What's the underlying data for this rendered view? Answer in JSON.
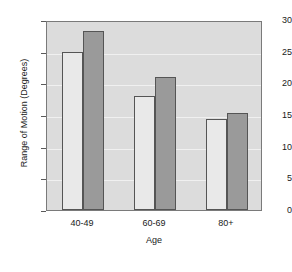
{
  "chart_data": {
    "type": "bar",
    "title": "",
    "xlabel": "Age",
    "ylabel": "Range of Motion (Degrees)",
    "categories": [
      "40-49",
      "60-69",
      "80+"
    ],
    "series": [
      {
        "name": "series-1",
        "color": "#e9e9e9",
        "values": [
          25.0,
          18.0,
          14.3
        ]
      },
      {
        "name": "series-2",
        "color": "#9a9a9a",
        "values": [
          28.3,
          21.0,
          15.3
        ]
      }
    ],
    "ylim": [
      0,
      30
    ],
    "yticks": [
      0,
      5,
      10,
      15,
      20,
      25,
      30
    ],
    "ytick_labels": [
      "0",
      "5",
      "10",
      "15",
      "20",
      "25",
      "30"
    ],
    "grid": true,
    "grid_axis": "y",
    "legend": "none",
    "plot_background": "#dcdcdc",
    "axis_color": "#7a7a7a"
  }
}
